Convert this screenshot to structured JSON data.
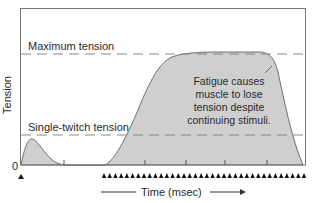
{
  "chart_data": {
    "type": "area",
    "title": "",
    "xlabel": "Time (msec)",
    "ylabel": "Tension",
    "y_tick_labels": [
      "0"
    ],
    "reference_lines": [
      {
        "name": "Maximum tension",
        "level": 1.0
      },
      {
        "name": "Single-twitch tension",
        "level": 0.25
      }
    ],
    "annotation": "Fatigue causes muscle to lose tension despite continuing stimuli.",
    "series": [
      {
        "name": "Tension",
        "x": [
          0,
          3,
          8,
          15,
          25,
          40,
          60,
          90,
          100,
          115,
          135,
          150,
          175,
          195,
          210,
          235,
          250,
          260,
          270,
          275,
          283
        ],
        "values": [
          0,
          0.15,
          0.25,
          0.2,
          0.08,
          0.0,
          0.0,
          0.0,
          0.08,
          0.4,
          0.8,
          0.95,
          1.0,
          1.0,
          1.0,
          1.0,
          0.96,
          0.8,
          0.45,
          0.2,
          0.0
        ]
      }
    ],
    "stimuli": {
      "single_stimulus_count": 1,
      "repeated_stimulus_count": 36
    },
    "grid": false,
    "legend": "none"
  },
  "labels": {
    "max_tension": "Maximum tension",
    "single_twitch": "Single-twitch tension",
    "y_axis": "Tension",
    "zero": "0",
    "x_axis": "Time (msec)",
    "annotation_lines": [
      "Fatigue causes",
      "muscle to lose",
      "tension despite",
      "continuing stimuli."
    ]
  }
}
